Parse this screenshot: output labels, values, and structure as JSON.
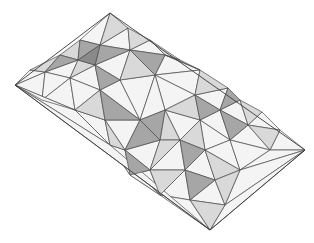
{
  "figure": {
    "title": "Low-poly faceted terrain (isometric wireframe)",
    "width": 314,
    "height": 243,
    "background": "#ffffff",
    "edge_color": "#4a4a4a",
    "shades": {
      "light": "#f4f4f4",
      "mid": "#d9d9d9",
      "dark": "#a6a6a6",
      "darker": "#8a8a8a"
    }
  },
  "outline": [
    [
      15,
      85
    ],
    [
      110,
      13
    ],
    [
      305,
      150
    ],
    [
      210,
      230
    ]
  ],
  "faces": [
    {
      "pts": [
        [
          15,
          85
        ],
        [
          45,
          72
        ],
        [
          42,
          100
        ]
      ],
      "shade": "light"
    },
    {
      "pts": [
        [
          45,
          72
        ],
        [
          30,
          70
        ],
        [
          15,
          85
        ]
      ],
      "shade": "light"
    },
    {
      "pts": [
        [
          30,
          70
        ],
        [
          60,
          55
        ],
        [
          45,
          72
        ]
      ],
      "shade": "mid"
    },
    {
      "pts": [
        [
          45,
          72
        ],
        [
          60,
          55
        ],
        [
          78,
          60
        ]
      ],
      "shade": "dark"
    },
    {
      "pts": [
        [
          45,
          72
        ],
        [
          78,
          60
        ],
        [
          70,
          78
        ]
      ],
      "shade": "light"
    },
    {
      "pts": [
        [
          42,
          100
        ],
        [
          45,
          72
        ],
        [
          70,
          78
        ]
      ],
      "shade": "light"
    },
    {
      "pts": [
        [
          42,
          100
        ],
        [
          70,
          78
        ],
        [
          75,
          110
        ]
      ],
      "shade": "light"
    },
    {
      "pts": [
        [
          60,
          55
        ],
        [
          80,
          40
        ],
        [
          78,
          60
        ]
      ],
      "shade": "mid"
    },
    {
      "pts": [
        [
          80,
          40
        ],
        [
          110,
          13
        ],
        [
          100,
          45
        ]
      ],
      "shade": "light"
    },
    {
      "pts": [
        [
          110,
          13
        ],
        [
          128,
          28
        ],
        [
          100,
          45
        ]
      ],
      "shade": "mid"
    },
    {
      "pts": [
        [
          80,
          40
        ],
        [
          100,
          45
        ],
        [
          78,
          60
        ]
      ],
      "shade": "dark"
    },
    {
      "pts": [
        [
          78,
          60
        ],
        [
          100,
          45
        ],
        [
          95,
          65
        ]
      ],
      "shade": "darker"
    },
    {
      "pts": [
        [
          78,
          60
        ],
        [
          95,
          65
        ],
        [
          70,
          78
        ]
      ],
      "shade": "mid"
    },
    {
      "pts": [
        [
          100,
          45
        ],
        [
          128,
          28
        ],
        [
          130,
          50
        ]
      ],
      "shade": "light"
    },
    {
      "pts": [
        [
          100,
          45
        ],
        [
          130,
          50
        ],
        [
          95,
          65
        ]
      ],
      "shade": "dark"
    },
    {
      "pts": [
        [
          128,
          28
        ],
        [
          150,
          40
        ],
        [
          130,
          50
        ]
      ],
      "shade": "mid"
    },
    {
      "pts": [
        [
          150,
          40
        ],
        [
          165,
          55
        ],
        [
          130,
          50
        ]
      ],
      "shade": "light"
    },
    {
      "pts": [
        [
          130,
          50
        ],
        [
          165,
          55
        ],
        [
          155,
          75
        ]
      ],
      "shade": "dark"
    },
    {
      "pts": [
        [
          95,
          65
        ],
        [
          130,
          50
        ],
        [
          120,
          80
        ]
      ],
      "shade": "light"
    },
    {
      "pts": [
        [
          120,
          80
        ],
        [
          130,
          50
        ],
        [
          155,
          75
        ]
      ],
      "shade": "mid"
    },
    {
      "pts": [
        [
          70,
          78
        ],
        [
          95,
          65
        ],
        [
          100,
          90
        ]
      ],
      "shade": "light"
    },
    {
      "pts": [
        [
          95,
          65
        ],
        [
          120,
          80
        ],
        [
          100,
          90
        ]
      ],
      "shade": "dark"
    },
    {
      "pts": [
        [
          75,
          110
        ],
        [
          70,
          78
        ],
        [
          100,
          90
        ]
      ],
      "shade": "light"
    },
    {
      "pts": [
        [
          75,
          110
        ],
        [
          100,
          90
        ],
        [
          105,
          120
        ]
      ],
      "shade": "mid"
    },
    {
      "pts": [
        [
          100,
          90
        ],
        [
          120,
          80
        ],
        [
          140,
          120
        ]
      ],
      "shade": "light"
    },
    {
      "pts": [
        [
          100,
          90
        ],
        [
          140,
          120
        ],
        [
          105,
          120
        ]
      ],
      "shade": "dark"
    },
    {
      "pts": [
        [
          120,
          80
        ],
        [
          155,
          75
        ],
        [
          140,
          120
        ]
      ],
      "shade": "light"
    },
    {
      "pts": [
        [
          165,
          55
        ],
        [
          200,
          70
        ],
        [
          155,
          75
        ]
      ],
      "shade": "light"
    },
    {
      "pts": [
        [
          150,
          40
        ],
        [
          180,
          60
        ],
        [
          165,
          55
        ]
      ],
      "shade": "mid"
    },
    {
      "pts": [
        [
          165,
          55
        ],
        [
          180,
          60
        ],
        [
          200,
          70
        ]
      ],
      "shade": "dark"
    },
    {
      "pts": [
        [
          200,
          70
        ],
        [
          228,
          88
        ],
        [
          195,
          95
        ]
      ],
      "shade": "mid"
    },
    {
      "pts": [
        [
          200,
          70
        ],
        [
          195,
          95
        ],
        [
          155,
          75
        ]
      ],
      "shade": "light"
    },
    {
      "pts": [
        [
          228,
          88
        ],
        [
          240,
          100
        ],
        [
          220,
          110
        ]
      ],
      "shade": "dark"
    },
    {
      "pts": [
        [
          195,
          95
        ],
        [
          228,
          88
        ],
        [
          220,
          110
        ]
      ],
      "shade": "light"
    },
    {
      "pts": [
        [
          155,
          75
        ],
        [
          195,
          95
        ],
        [
          165,
          110
        ]
      ],
      "shade": "light"
    },
    {
      "pts": [
        [
          165,
          110
        ],
        [
          195,
          95
        ],
        [
          200,
          120
        ]
      ],
      "shade": "mid"
    },
    {
      "pts": [
        [
          195,
          95
        ],
        [
          220,
          110
        ],
        [
          200,
          120
        ]
      ],
      "shade": "dark"
    },
    {
      "pts": [
        [
          140,
          120
        ],
        [
          155,
          75
        ],
        [
          165,
          110
        ]
      ],
      "shade": "light"
    },
    {
      "pts": [
        [
          140,
          120
        ],
        [
          165,
          110
        ],
        [
          160,
          140
        ]
      ],
      "shade": "dark"
    },
    {
      "pts": [
        [
          165,
          110
        ],
        [
          200,
          120
        ],
        [
          180,
          140
        ]
      ],
      "shade": "light"
    },
    {
      "pts": [
        [
          160,
          140
        ],
        [
          165,
          110
        ],
        [
          180,
          140
        ]
      ],
      "shade": "mid"
    },
    {
      "pts": [
        [
          240,
          100
        ],
        [
          262,
          112
        ],
        [
          248,
          125
        ]
      ],
      "shade": "mid"
    },
    {
      "pts": [
        [
          220,
          110
        ],
        [
          240,
          100
        ],
        [
          248,
          125
        ]
      ],
      "shade": "light"
    },
    {
      "pts": [
        [
          262,
          112
        ],
        [
          280,
          130
        ],
        [
          248,
          125
        ]
      ],
      "shade": "light"
    },
    {
      "pts": [
        [
          280,
          130
        ],
        [
          305,
          150
        ],
        [
          270,
          150
        ]
      ],
      "shade": "light"
    },
    {
      "pts": [
        [
          248,
          125
        ],
        [
          280,
          130
        ],
        [
          270,
          150
        ]
      ],
      "shade": "mid"
    },
    {
      "pts": [
        [
          200,
          120
        ],
        [
          220,
          110
        ],
        [
          230,
          140
        ]
      ],
      "shade": "light"
    },
    {
      "pts": [
        [
          220,
          110
        ],
        [
          248,
          125
        ],
        [
          230,
          140
        ]
      ],
      "shade": "dark"
    },
    {
      "pts": [
        [
          230,
          140
        ],
        [
          248,
          125
        ],
        [
          270,
          150
        ]
      ],
      "shade": "light"
    },
    {
      "pts": [
        [
          180,
          140
        ],
        [
          200,
          120
        ],
        [
          205,
          150
        ]
      ],
      "shade": "mid"
    },
    {
      "pts": [
        [
          200,
          120
        ],
        [
          230,
          140
        ],
        [
          205,
          150
        ]
      ],
      "shade": "light"
    },
    {
      "pts": [
        [
          105,
          120
        ],
        [
          140,
          120
        ],
        [
          125,
          150
        ]
      ],
      "shade": "light"
    },
    {
      "pts": [
        [
          75,
          110
        ],
        [
          105,
          120
        ],
        [
          110,
          145
        ]
      ],
      "shade": "light"
    },
    {
      "pts": [
        [
          110,
          145
        ],
        [
          105,
          120
        ],
        [
          125,
          150
        ]
      ],
      "shade": "mid"
    },
    {
      "pts": [
        [
          125,
          150
        ],
        [
          140,
          120
        ],
        [
          160,
          140
        ]
      ],
      "shade": "dark"
    },
    {
      "pts": [
        [
          125,
          150
        ],
        [
          160,
          140
        ],
        [
          150,
          170
        ]
      ],
      "shade": "light"
    },
    {
      "pts": [
        [
          150,
          170
        ],
        [
          160,
          140
        ],
        [
          180,
          140
        ]
      ],
      "shade": "mid"
    },
    {
      "pts": [
        [
          150,
          170
        ],
        [
          180,
          140
        ],
        [
          185,
          170
        ]
      ],
      "shade": "light"
    },
    {
      "pts": [
        [
          185,
          170
        ],
        [
          180,
          140
        ],
        [
          205,
          150
        ]
      ],
      "shade": "dark"
    },
    {
      "pts": [
        [
          185,
          170
        ],
        [
          205,
          150
        ],
        [
          215,
          180
        ]
      ],
      "shade": "light"
    },
    {
      "pts": [
        [
          205,
          150
        ],
        [
          230,
          140
        ],
        [
          240,
          170
        ]
      ],
      "shade": "light"
    },
    {
      "pts": [
        [
          205,
          150
        ],
        [
          240,
          170
        ],
        [
          215,
          180
        ]
      ],
      "shade": "mid"
    },
    {
      "pts": [
        [
          230,
          140
        ],
        [
          270,
          150
        ],
        [
          240,
          170
        ]
      ],
      "shade": "light"
    },
    {
      "pts": [
        [
          240,
          170
        ],
        [
          270,
          150
        ],
        [
          305,
          150
        ]
      ],
      "shade": "light"
    },
    {
      "pts": [
        [
          110,
          145
        ],
        [
          125,
          150
        ],
        [
          130,
          175
        ]
      ],
      "shade": "light"
    },
    {
      "pts": [
        [
          130,
          175
        ],
        [
          125,
          150
        ],
        [
          150,
          170
        ]
      ],
      "shade": "dark"
    },
    {
      "pts": [
        [
          130,
          175
        ],
        [
          150,
          170
        ],
        [
          160,
          195
        ]
      ],
      "shade": "light"
    },
    {
      "pts": [
        [
          160,
          195
        ],
        [
          150,
          170
        ],
        [
          185,
          170
        ]
      ],
      "shade": "mid"
    },
    {
      "pts": [
        [
          160,
          195
        ],
        [
          185,
          170
        ],
        [
          190,
          200
        ]
      ],
      "shade": "light"
    },
    {
      "pts": [
        [
          190,
          200
        ],
        [
          185,
          170
        ],
        [
          215,
          180
        ]
      ],
      "shade": "dark"
    },
    {
      "pts": [
        [
          190,
          200
        ],
        [
          215,
          180
        ],
        [
          225,
          205
        ]
      ],
      "shade": "light"
    },
    {
      "pts": [
        [
          215,
          180
        ],
        [
          240,
          170
        ],
        [
          225,
          205
        ]
      ],
      "shade": "mid"
    },
    {
      "pts": [
        [
          225,
          205
        ],
        [
          240,
          170
        ],
        [
          305,
          150
        ]
      ],
      "shade": "light"
    },
    {
      "pts": [
        [
          75,
          110
        ],
        [
          110,
          145
        ],
        [
          15,
          85
        ]
      ],
      "shade": "light"
    },
    {
      "pts": [
        [
          15,
          85
        ],
        [
          42,
          100
        ],
        [
          75,
          110
        ]
      ],
      "shade": "light"
    },
    {
      "pts": [
        [
          110,
          145
        ],
        [
          130,
          175
        ],
        [
          160,
          195
        ]
      ],
      "shade": "light"
    },
    {
      "pts": [
        [
          160,
          195
        ],
        [
          190,
          200
        ],
        [
          210,
          230
        ]
      ],
      "shade": "light"
    },
    {
      "pts": [
        [
          190,
          200
        ],
        [
          225,
          205
        ],
        [
          210,
          230
        ]
      ],
      "shade": "mid"
    },
    {
      "pts": [
        [
          225,
          205
        ],
        [
          305,
          150
        ],
        [
          210,
          230
        ]
      ],
      "shade": "light"
    },
    {
      "pts": [
        [
          15,
          85
        ],
        [
          110,
          145
        ],
        [
          210,
          230
        ]
      ],
      "shade": "light"
    }
  ]
}
